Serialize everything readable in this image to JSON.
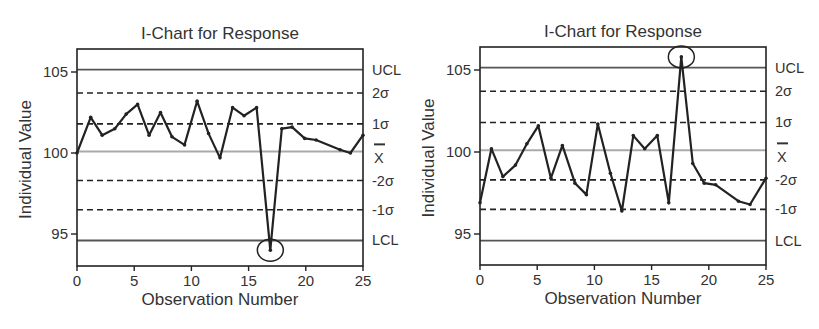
{
  "chart_data": [
    {
      "type": "line",
      "title": "I-Chart for Response",
      "xlabel": "Observation Number",
      "ylabel": "Individual Value",
      "xlim": [
        0,
        25
      ],
      "ylim": [
        93.2,
        106.5
      ],
      "xticks": [
        0,
        5,
        10,
        15,
        20,
        25
      ],
      "yticks": [
        95,
        100,
        105
      ],
      "grid": false,
      "legend": null,
      "control_lines": [
        {
          "label": "UCL",
          "value": 105.15,
          "style": "solid"
        },
        {
          "label": "2σ",
          "value": 103.7,
          "style": "dashed"
        },
        {
          "label": "1σ",
          "value": 101.8,
          "style": "dashed"
        },
        {
          "label": "X̄",
          "value": 100.1,
          "style": "center"
        },
        {
          "label": "-2σ",
          "value": 98.3,
          "style": "dashed"
        },
        {
          "label": "-1σ",
          "value": 96.5,
          "style": "dashed"
        },
        {
          "label": "LCL",
          "value": 94.6,
          "style": "solid"
        }
      ],
      "series": [
        {
          "name": "Response",
          "x": [
            0,
            1.2,
            2.2,
            3.3,
            4.3,
            5.3,
            6.3,
            7.3,
            8.3,
            9.4,
            10.5,
            11.5,
            12.5,
            13.6,
            14.6,
            15.7,
            16.9,
            17.9,
            18.8,
            19.9,
            20.9,
            23.0,
            23.9,
            25.0
          ],
          "values": [
            100.0,
            102.2,
            101.1,
            101.5,
            102.4,
            103.0,
            101.1,
            102.5,
            101.0,
            100.5,
            103.2,
            101.2,
            99.7,
            102.8,
            102.3,
            102.8,
            94.0,
            101.5,
            101.6,
            100.9,
            100.8,
            100.2,
            100.0,
            101.1
          ]
        }
      ],
      "annotations": [
        {
          "type": "circle",
          "x": 16.9,
          "y": 94.0,
          "note": "out-of-control point below LCL"
        }
      ]
    },
    {
      "type": "line",
      "title": "I-Chart for Response",
      "xlabel": "Observation Number",
      "ylabel": "Individual Value",
      "xlim": [
        0,
        25
      ],
      "ylim": [
        93.2,
        106.5
      ],
      "xticks": [
        0,
        5,
        10,
        15,
        20,
        25
      ],
      "yticks": [
        95,
        100,
        105
      ],
      "grid": false,
      "legend": null,
      "control_lines": [
        {
          "label": "UCL",
          "value": 105.15,
          "style": "solid"
        },
        {
          "label": "2σ",
          "value": 103.7,
          "style": "dashed"
        },
        {
          "label": "1σ",
          "value": 101.8,
          "style": "dashed"
        },
        {
          "label": "X̄",
          "value": 100.1,
          "style": "center"
        },
        {
          "label": "-2σ",
          "value": 98.3,
          "style": "dashed"
        },
        {
          "label": "-1σ",
          "value": 96.5,
          "style": "dashed"
        },
        {
          "label": "LCL",
          "value": 94.6,
          "style": "solid"
        }
      ],
      "series": [
        {
          "name": "Response",
          "x": [
            0,
            1.0,
            2.0,
            3.1,
            4.1,
            5.1,
            6.2,
            7.2,
            8.3,
            9.3,
            10.3,
            11.4,
            12.4,
            13.4,
            14.4,
            15.5,
            16.5,
            17.6,
            18.6,
            19.6,
            20.6,
            22.6,
            23.6,
            25.0
          ],
          "values": [
            96.9,
            100.2,
            98.5,
            99.2,
            100.5,
            101.6,
            98.4,
            100.4,
            98.1,
            97.4,
            101.7,
            98.7,
            96.4,
            101.0,
            100.2,
            101.0,
            96.9,
            105.8,
            99.3,
            98.1,
            98.0,
            97.0,
            96.8,
            98.4
          ]
        }
      ],
      "annotations": [
        {
          "type": "circle",
          "x": 17.6,
          "y": 105.8,
          "note": "out-of-control point above UCL"
        }
      ]
    }
  ],
  "layout": [
    {
      "frame": {
        "left": 77,
        "right": 363,
        "top": 49,
        "bottom": 266
      },
      "y100": 153,
      "y105": 72
    },
    {
      "frame": {
        "left": 480,
        "right": 766,
        "top": 47,
        "bottom": 265
      },
      "y100": 152,
      "y105": 70
    }
  ],
  "colors": {
    "data_line": "#222222",
    "control_limit": "#555555",
    "sigma_dashed": "#222222",
    "center_line": "#aaaaaa",
    "frame": "#222222"
  }
}
